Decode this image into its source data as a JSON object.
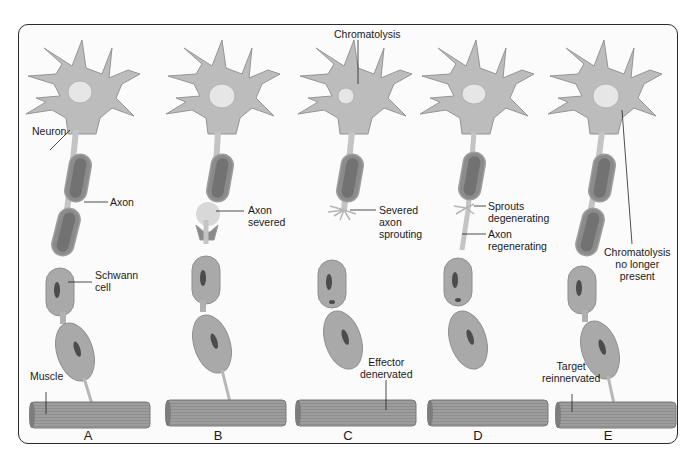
{
  "figure": {
    "type": "diagram",
    "panels": [
      {
        "letter": "A",
        "labels": {
          "neuron": "Neuron",
          "axon": "Axon",
          "schwann": "Schwann\ncell",
          "muscle": "Muscle"
        }
      },
      {
        "letter": "B",
        "labels": {
          "axon_severed": "Axon\nsevered"
        }
      },
      {
        "letter": "C",
        "labels": {
          "chromatolysis": "Chromatolysis",
          "severed_sprouting": "Severed\naxon\nsprouting",
          "effector_denervated": "Effector\ndenervated"
        }
      },
      {
        "letter": "D",
        "labels": {
          "sprouts_degenerating": "Sprouts\ndegenerating",
          "axon_regenerating": "Axon\nregenerating"
        }
      },
      {
        "letter": "E",
        "labels": {
          "chromatolysis_gone": "Chromatolysis\nno longer\npresent",
          "target_reinnervated": "Target\nreinnervated"
        }
      }
    ],
    "colors": {
      "cell_fill": "#b9b9b9",
      "cell_stroke": "#8f8f8f",
      "nucleus": "#e6e6e6",
      "myelin": "#8a8a8a",
      "myelin_dark": "#6f6f6f",
      "schwann_nucleus": "#4a4a4a",
      "muscle": "#8c8c8c",
      "muscle_stripe": "#a8a8a8",
      "border": "#2a2a2a"
    }
  }
}
